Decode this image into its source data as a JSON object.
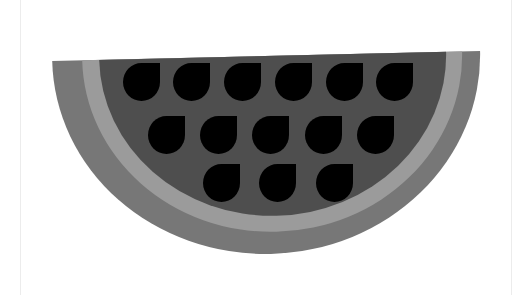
{
  "illustration": {
    "subject": "watermelon-slice",
    "colors": {
      "background": "#ffffff",
      "frame_line": "#ececec",
      "outer_rind": "#777777",
      "inner_rind": "#9b9b9b",
      "flesh": "#4e4e4e",
      "seed": "#000000"
    },
    "seed_size": {
      "w": 37,
      "h": 38
    },
    "seeds": [
      {
        "x": 123,
        "y": 63
      },
      {
        "x": 173,
        "y": 63
      },
      {
        "x": 224,
        "y": 63
      },
      {
        "x": 275,
        "y": 63
      },
      {
        "x": 326,
        "y": 63
      },
      {
        "x": 376,
        "y": 63
      },
      {
        "x": 148,
        "y": 116
      },
      {
        "x": 200,
        "y": 116
      },
      {
        "x": 252,
        "y": 116
      },
      {
        "x": 305,
        "y": 116
      },
      {
        "x": 357,
        "y": 116
      },
      {
        "x": 203,
        "y": 164
      },
      {
        "x": 259,
        "y": 164
      },
      {
        "x": 316,
        "y": 164
      }
    ]
  }
}
